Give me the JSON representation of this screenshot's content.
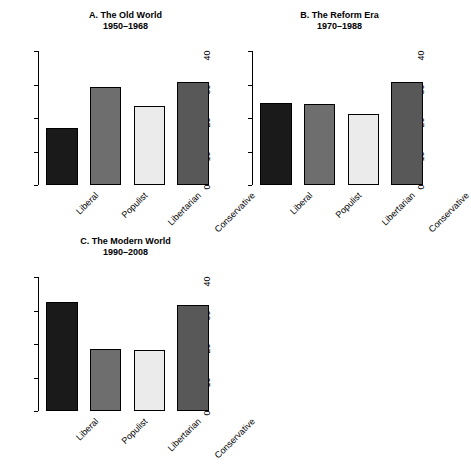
{
  "chart_data": [
    {
      "type": "bar",
      "panel": "A",
      "title": "A. The Old World",
      "subtitle": "1950–1968",
      "categories": [
        "Liberal",
        "Populist",
        "Libertarian",
        "Conservative"
      ],
      "values": [
        17,
        29.2,
        23.7,
        30.9
      ],
      "colors": [
        "#1a1a1a",
        "#6e6e6e",
        "#ebebeb",
        "#585858"
      ],
      "xlabel": "",
      "ylabel": "",
      "ylim": [
        0,
        40
      ],
      "yticks": [
        0,
        10,
        20,
        30,
        40
      ],
      "grid": false,
      "legend": "none"
    },
    {
      "type": "bar",
      "panel": "B",
      "title": "B. The Reform Era",
      "subtitle": "1970–1988",
      "categories": [
        "Liberal",
        "Populist",
        "Libertarian",
        "Conservative"
      ],
      "values": [
        24.5,
        24.2,
        21.1,
        30.9
      ],
      "colors": [
        "#1a1a1a",
        "#6e6e6e",
        "#ebebeb",
        "#585858"
      ],
      "xlabel": "",
      "ylabel": "",
      "ylim": [
        0,
        40
      ],
      "yticks": [
        0,
        10,
        20,
        30,
        40
      ],
      "grid": false,
      "legend": "none"
    },
    {
      "type": "bar",
      "panel": "C",
      "title": "C. The Modern World",
      "subtitle": "1990–2008",
      "categories": [
        "Liberal",
        "Populist",
        "Libertarian",
        "Conservative"
      ],
      "values": [
        32.4,
        18.5,
        18.1,
        31.7
      ],
      "colors": [
        "#1a1a1a",
        "#6e6e6e",
        "#ebebeb",
        "#585858"
      ],
      "xlabel": "",
      "ylabel": "",
      "ylim": [
        0,
        40
      ],
      "yticks": [
        0,
        10,
        20,
        30,
        40
      ],
      "grid": false,
      "legend": "none"
    }
  ],
  "figure": {
    "background": "#ffffff",
    "axis_color": "#000000",
    "panel_count": 3
  }
}
